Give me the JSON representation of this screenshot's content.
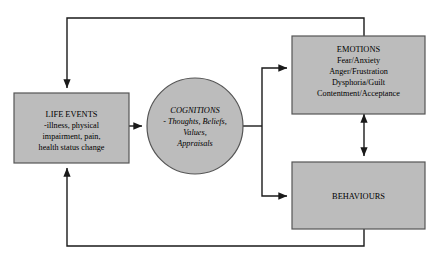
{
  "diagram": {
    "background_color": "#ffffff",
    "node_fill_color": "#bcbcbc",
    "node_border_color": "#555555",
    "edge_color": "#1a1a1a",
    "nodes": {
      "life_events": {
        "name": "LIFE EVENTS",
        "shape": "rectangle",
        "lines": [
          "LIFE EVENTS",
          "-illness, physical",
          "impairment, pain,",
          "health status change"
        ]
      },
      "cognitions": {
        "name": "COGNITIONS",
        "shape": "circle",
        "style": "italic",
        "lines": [
          "COGNITIONS",
          "- Thoughts, Beliefs,",
          "Values,",
          "Appraisals"
        ]
      },
      "emotions": {
        "name": "EMOTIONS",
        "shape": "rectangle",
        "lines": [
          "EMOTIONS",
          "Fear/Anxiety",
          "Anger/Frustration",
          "Dysphoria/Guilt",
          "Contentment/Acceptance"
        ]
      },
      "behaviours": {
        "name": "BEHAVIOURS",
        "shape": "rectangle",
        "lines": [
          "BEHAVIOURS"
        ]
      }
    },
    "edges": [
      {
        "id": "life-events-to-cognitions",
        "from": "life_events",
        "to": "cognitions",
        "direction": "forward",
        "style": "straight"
      },
      {
        "id": "cognitions-to-emotions",
        "from": "cognitions",
        "to": "emotions",
        "direction": "forward",
        "style": "elbow"
      },
      {
        "id": "cognitions-to-behaviours",
        "from": "cognitions",
        "to": "behaviours",
        "direction": "forward",
        "style": "elbow"
      },
      {
        "id": "emotions-behaviours-bidirectional",
        "from": "emotions",
        "to": "behaviours",
        "direction": "both",
        "style": "straight"
      },
      {
        "id": "emotions-to-life-events-feedback",
        "from": "emotions",
        "to": "life_events",
        "direction": "forward",
        "style": "loop-top"
      },
      {
        "id": "behaviours-to-life-events-feedback",
        "from": "behaviours",
        "to": "life_events",
        "direction": "forward",
        "style": "loop-bottom"
      }
    ]
  }
}
